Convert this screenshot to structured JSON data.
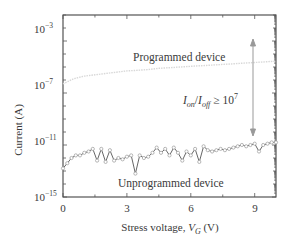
{
  "chart_data": {
    "type": "scatter",
    "title": "",
    "xlabel": "Stress voltage, V_G (V)",
    "xlabel_parts": {
      "pre": "Stress voltage, ",
      "var": "V",
      "sub": "G",
      "post": " (V)"
    },
    "ylabel": "Current (A)",
    "xlim": [
      0,
      10
    ],
    "ylim_log10": [
      -15,
      -1
    ],
    "yscale": "log",
    "x_ticks": [
      0,
      3,
      6,
      9
    ],
    "x_tick_labels": [
      "0",
      "3",
      "6",
      "9"
    ],
    "y_ticks_log10": [
      -3,
      -7,
      -11,
      -15
    ],
    "y_tick_labels": [
      {
        "base": "10",
        "exp": "−3"
      },
      {
        "base": "10",
        "exp": "−7"
      },
      {
        "base": "10",
        "exp": "−11"
      },
      {
        "base": "10",
        "exp": "−15"
      }
    ],
    "grid": false,
    "legend": null,
    "series": [
      {
        "name": "Programmed device",
        "style": "faint line",
        "x": [
          0,
          0.5,
          1,
          1.5,
          2,
          2.5,
          3,
          3.5,
          4,
          4.5,
          5,
          5.5,
          6,
          6.5,
          7,
          7.5,
          8,
          8.5,
          9,
          9.5,
          10
        ],
        "y_log10": [
          -6.3,
          -5.9,
          -5.7,
          -5.6,
          -5.5,
          -5.4,
          -5.3,
          -5.25,
          -5.2,
          -5.1,
          -5.05,
          -5.0,
          -4.95,
          -4.9,
          -4.85,
          -4.8,
          -4.75,
          -4.7,
          -4.65,
          -4.6,
          -4.55
        ]
      },
      {
        "name": "Unprogrammed device",
        "style": "line with open circle markers",
        "x": [
          0,
          0.2,
          0.4,
          0.6,
          0.8,
          1.0,
          1.2,
          1.4,
          1.6,
          1.8,
          2.0,
          2.2,
          2.4,
          2.6,
          2.8,
          3.0,
          3.2,
          3.4,
          3.6,
          3.8,
          4.0,
          4.2,
          4.4,
          4.6,
          4.8,
          5.0,
          5.2,
          5.4,
          5.6,
          5.8,
          6.0,
          6.2,
          6.4,
          6.6,
          6.8,
          7.0,
          7.2,
          7.4,
          7.6,
          7.8,
          8.0,
          8.2,
          8.4,
          8.6,
          8.8,
          9.0,
          9.2,
          9.4,
          9.6,
          9.8,
          10.0
        ],
        "y_log10": [
          -12.8,
          -12.4,
          -12.0,
          -11.8,
          -11.8,
          -11.6,
          -11.5,
          -11.3,
          -12.2,
          -11.3,
          -12.3,
          -11.4,
          -12.2,
          -12.0,
          -12.1,
          -11.9,
          -11.8,
          -13.2,
          -11.8,
          -12.0,
          -11.9,
          -11.6,
          -11.2,
          -11.6,
          -11.3,
          -11.8,
          -11.2,
          -11.6,
          -12.2,
          -11.5,
          -11.8,
          -11.3,
          -12.3,
          -11.1,
          -11.4,
          -11.5,
          -11.4,
          -11.3,
          -11.4,
          -11.3,
          -11.2,
          -11.1,
          -11.0,
          -11.1,
          -11.0,
          -10.9,
          -11.5,
          -11.0,
          -10.9,
          -10.8,
          -10.8
        ]
      }
    ],
    "annotations": [
      {
        "text": "Programmed device",
        "x": 5.5,
        "y_log10": -5.3
      },
      {
        "text": "Unprogrammed device",
        "x": 5.5,
        "y_log10": -13.8
      },
      {
        "text": "I_on/I_off ≥ 10^7",
        "x": 7.0,
        "y_log10": -8.4
      },
      {
        "type": "double-arrow",
        "x": 8.9,
        "from_y_log10": -4.8,
        "to_y_log10": -11.5
      }
    ]
  },
  "labels": {
    "programmed": "Programmed device",
    "unprogrammed": "Unprogrammed device",
    "ratio": {
      "I": "I",
      "on": "on",
      "slash": "/",
      "off": "off",
      "ge": " ≥ 10",
      "exp": "7"
    }
  }
}
